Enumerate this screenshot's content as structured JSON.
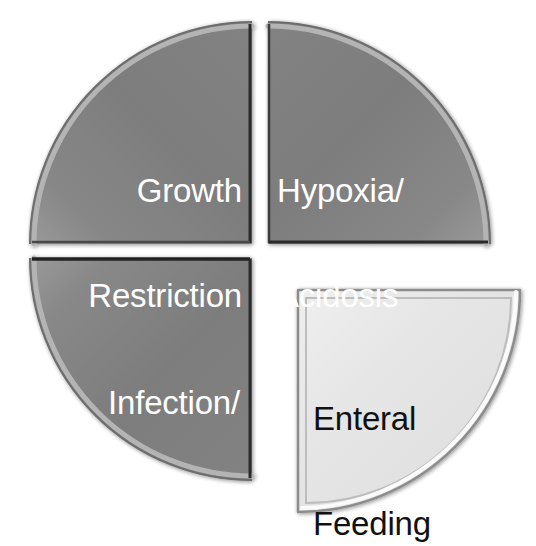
{
  "diagram": {
    "type": "quadrant-pie",
    "background_color": "#ffffff",
    "segment_fill_color": "#808080",
    "highlight_segment_fill_color": "#e6e6e6",
    "segment_text_color": "#ffffff",
    "highlight_segment_text_color": "#111111",
    "segment_count": 4,
    "segments": [
      {
        "id": "growth-restriction",
        "position": "top-left",
        "line1": "Growth",
        "line2": "Restriction",
        "fill": "#808080",
        "text_color": "#ffffff",
        "highlighted": "false",
        "exploded": "false"
      },
      {
        "id": "hypoxia-acidosis",
        "position": "top-right",
        "line1": "Hypoxia/",
        "line2": "Acidosis",
        "fill": "#808080",
        "text_color": "#ffffff",
        "highlighted": "false",
        "exploded": "false"
      },
      {
        "id": "infection-antibiotics",
        "position": "bottom-left",
        "line1": "Infection/",
        "line2": "Antibiotics",
        "fill": "#808080",
        "text_color": "#ffffff",
        "highlighted": "false",
        "exploded": "false"
      },
      {
        "id": "enteral-feeding",
        "position": "bottom-right",
        "line1": "Enteral",
        "line2": "Feeding",
        "fill": "#e6e6e6",
        "text_color": "#111111",
        "highlighted": "true",
        "exploded": "true"
      }
    ]
  }
}
